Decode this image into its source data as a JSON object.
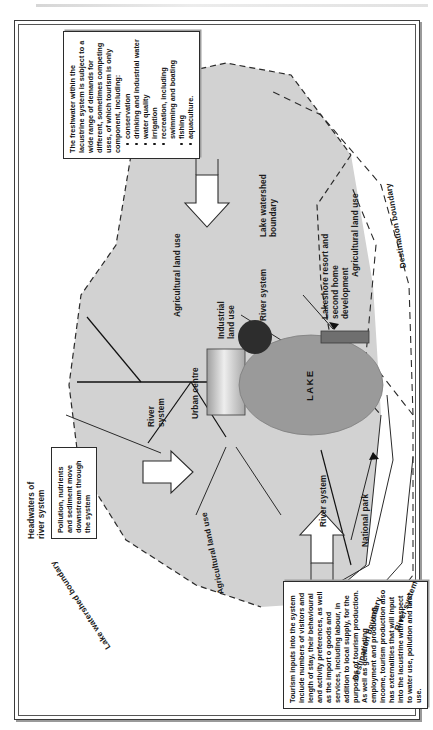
{
  "figure": {
    "orientation": "rotated-90-ccw"
  },
  "colors": {
    "watershed_fill": "#d2d2d2",
    "lake_fill": "#9a9a9a",
    "urban_fill": "#b4b4b4",
    "industrial_fill": "#2d2d2d",
    "resort_fill": "#6f6f6f",
    "line": "#1a1a1a",
    "frame": "#3a3a3a",
    "paper": "#ffffff"
  },
  "labels": {
    "lake_watershed_boundary_left": "Lake watershed boundary",
    "lake_watershed_boundary_right": "Lake watershed\nboundary",
    "agricultural_land_use_1": "Agricultural land use",
    "agricultural_land_use_2": "Agricultural land use",
    "agricultural_land_use_3": "Agricultural land use",
    "headwaters": "Headwaters of\nriver system",
    "river_system_main": "River\nsystem",
    "river_system_mid": "River system",
    "river_system_left": "River system",
    "river_system_lower": "River system",
    "urban_centre": "Urban centre",
    "industrial_land_use": "Industrial\nland use",
    "lake": "LAKE",
    "lakeshore_resort": "Lakeshore resort and\nsecond home\ndevelopment",
    "national_park": "National park",
    "destination_boundary_upper": "Destination boundary",
    "destination_boundary_lower": "Destination boundary"
  },
  "notes": {
    "pollution": {
      "text": "Pollution, nutrients\nand sediment move\ndownstream through\nthe system"
    },
    "freshwater": {
      "intro": "The freshwater within the lacustrine system is subject to a wide range of demands for different, sometimes competing uses, of which tourism is only component, including:",
      "items": [
        "conservation",
        "drinking and industrial water",
        "water quality",
        "irrigation",
        "recreation, including swimming and boating",
        "fishing",
        "aquaculture."
      ]
    },
    "tourism": {
      "text": "Tourism inputs into the system include numbers of visitors and length of stay, their behavioural and activity preferences, as well as the import o goods and services, including labour, in addition to local supply, for the purposes of tourism production. As well as generating employment and producing income, tourism production also has externalities that will input into the lacustrine with respect to water use, pollution and land use."
    }
  }
}
